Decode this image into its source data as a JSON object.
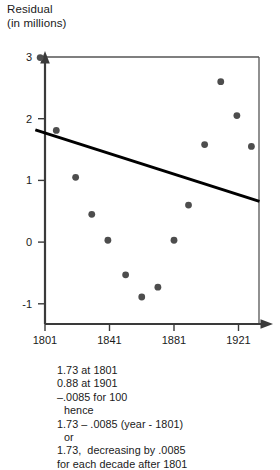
{
  "axis": {
    "y_title_line1": "Residual",
    "y_title_line2": "(in millions)",
    "y_ticks": [
      "3",
      "2",
      "1",
      "0",
      "-1"
    ],
    "x_ticks": [
      "1801",
      "1841",
      "1881",
      "1921"
    ]
  },
  "notes": {
    "line1": "1.73 at 1801",
    "line2": "0.88 at 1901",
    "line3": "–.0085 for 100",
    "line4": "hence",
    "line5": "1.73 – .0085 (year - 1801)",
    "line6": "or",
    "line7": "1.73,  decreasing by .0085",
    "line8": "for each decade after 1801"
  },
  "chart_data": {
    "type": "scatter",
    "title": "",
    "xlabel": "",
    "ylabel": "Residual (in millions)",
    "xlim": [
      1780,
      1940
    ],
    "ylim": [
      -1.55,
      3.45
    ],
    "grid": false,
    "legend": "none",
    "xticks": [
      1801,
      1841,
      1881,
      1921
    ],
    "yticks": [
      -1,
      0,
      1,
      2,
      3
    ],
    "point_color": "#4d4d4d",
    "line_color": "#000000",
    "points": [
      {
        "x": 1798,
        "y": 2.99
      },
      {
        "x": 1808,
        "y": 1.81
      },
      {
        "x": 1820,
        "y": 1.05
      },
      {
        "x": 1830,
        "y": 0.45
      },
      {
        "x": 1840,
        "y": 0.03
      },
      {
        "x": 1851,
        "y": -0.53
      },
      {
        "x": 1861,
        "y": -0.89
      },
      {
        "x": 1871,
        "y": -0.73
      },
      {
        "x": 1881,
        "y": 0.03
      },
      {
        "x": 1890,
        "y": 0.6
      },
      {
        "x": 1900,
        "y": 1.58
      },
      {
        "x": 1910,
        "y": 2.6
      },
      {
        "x": 1920,
        "y": 2.05
      },
      {
        "x": 1929,
        "y": 1.55
      }
    ],
    "fit_line": {
      "label": "residual trend line",
      "x_start": 1795,
      "y_start": 1.82,
      "x_end": 1934,
      "y_end": 0.66
    }
  }
}
